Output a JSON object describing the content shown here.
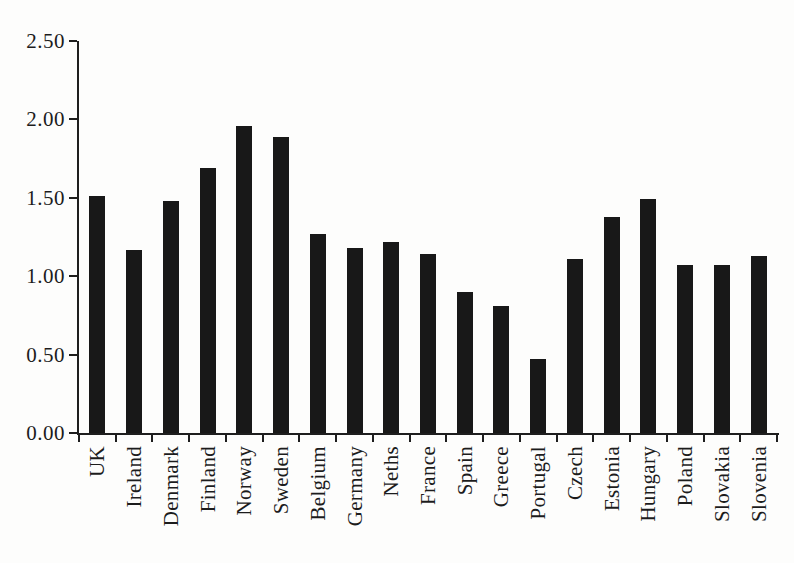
{
  "figure": {
    "title": "",
    "background": "#fdfdfc"
  },
  "chart_data": {
    "type": "bar",
    "title": "",
    "xlabel": "",
    "ylabel": "",
    "categories": [
      "UK",
      "Ireland",
      "Denmark",
      "Finland",
      "Norway",
      "Sweden",
      "Belgium",
      "Germany",
      "Neths",
      "France",
      "Spain",
      "Greece",
      "Portugal",
      "Czech",
      "Estonia",
      "Hungary",
      "Poland",
      "Slovakia",
      "Slovenia"
    ],
    "values": [
      1.51,
      1.17,
      1.48,
      1.69,
      1.96,
      1.89,
      1.27,
      1.18,
      1.22,
      1.14,
      0.9,
      0.81,
      0.47,
      1.11,
      1.38,
      1.49,
      1.07,
      1.07,
      1.13
    ],
    "ylim": [
      0,
      2.5
    ],
    "y_tick_labels": [
      "0.00",
      "0.50",
      "1.00",
      "1.50",
      "2.00",
      "2.50"
    ],
    "y_tick_values": [
      0,
      0.5,
      1.0,
      1.5,
      2.0,
      2.5
    ],
    "x_tick_style": "boundary-ticks-between-bars",
    "x_label_rotation_deg": -90,
    "grid": false,
    "legend": null,
    "bar_color": "#181818",
    "axis_color": "#1e1e1e",
    "text_color": "#1c1c1c"
  }
}
